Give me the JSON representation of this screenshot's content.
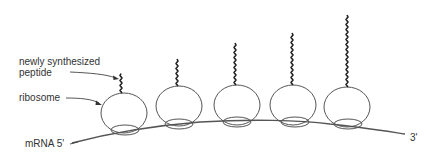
{
  "labels": {
    "peptide_line1": "newly synthesized",
    "peptide_line2": "peptide",
    "ribosome": "ribosome",
    "mrna_5prime": "mRNA 5'",
    "mrna_3prime": "3'"
  },
  "colors": {
    "line": "#555555",
    "peptide": "#222222",
    "text": "#333333",
    "background": "#ffffff"
  },
  "ribosomes": [
    {
      "cx": 124,
      "cy": 113,
      "peptide_top": 73
    },
    {
      "cx": 179,
      "cy": 106,
      "peptide_top": 60
    },
    {
      "cx": 237,
      "cy": 105,
      "peptide_top": 43
    },
    {
      "cx": 293,
      "cy": 105,
      "peptide_top": 32
    },
    {
      "cx": 347,
      "cy": 107,
      "peptide_top": 15
    }
  ]
}
